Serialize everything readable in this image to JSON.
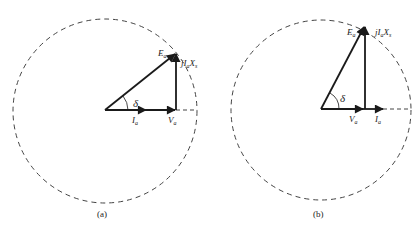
{
  "figures": [
    {
      "id": "a",
      "caption": "(a)",
      "labels": {
        "Ea": "E",
        "Ea_sub": "a",
        "jIaXs_j": "jI",
        "jIaXs_sub": "a",
        "jIaXs_X": "X",
        "jIaXs_s": "s",
        "delta": "δ",
        "Ia": "I",
        "Ia_sub": "a",
        "Va": "V",
        "Va_sub": "a"
      }
    },
    {
      "id": "b",
      "caption": "(b)",
      "labels": {
        "Ea": "E",
        "Ea_sub": "a",
        "jIaXs_j": "jI",
        "jIaXs_sub": "a",
        "jIaXs_X": "X",
        "jIaXs_s": "s",
        "delta": "δ",
        "Ia": "I",
        "Ia_sub": "a",
        "Va": "V",
        "Va_sub": "a"
      }
    }
  ],
  "colors": {
    "stroke": "#1a1a1a",
    "dashed": "#444444"
  }
}
